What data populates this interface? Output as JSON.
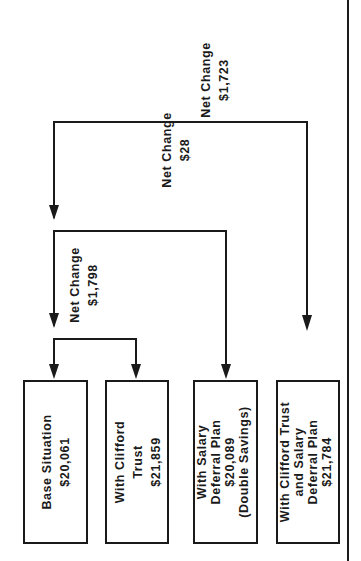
{
  "diagram": {
    "orientation": "rotated-90-ccw",
    "boxes": [
      {
        "id": "base",
        "lines": [
          "Base Situation",
          "$20,061"
        ]
      },
      {
        "id": "clifford",
        "lines": [
          "With Clifford",
          "Trust",
          "$21,859"
        ]
      },
      {
        "id": "salary",
        "lines": [
          "With Salary",
          "Deferral Plan",
          "$20,089",
          "(Double Savings)"
        ]
      },
      {
        "id": "both",
        "lines": [
          "With Clifford Trust",
          "and Salary",
          "Deferral Plan",
          "$21,784"
        ]
      }
    ],
    "changes": [
      {
        "id": "base-to-clifford",
        "lines": [
          "Net Change",
          "$1,798"
        ]
      },
      {
        "id": "base-to-salary",
        "lines": [
          "Net Change",
          "$28"
        ]
      },
      {
        "id": "base-to-both",
        "lines": [
          "Net Change",
          "$1,723"
        ]
      }
    ]
  }
}
